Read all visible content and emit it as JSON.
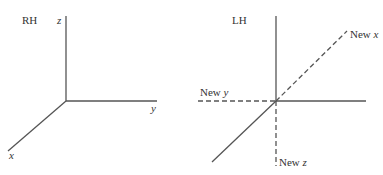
{
  "diagram": {
    "left_panel": {
      "title": "RH",
      "axes": {
        "z": {
          "label": "z"
        },
        "y": {
          "label": "y"
        },
        "x": {
          "label": "x"
        }
      }
    },
    "right_panel": {
      "title": "LH",
      "axes": {
        "new_x": {
          "prefix": "New ",
          "var": "x"
        },
        "new_y": {
          "prefix": "New ",
          "var": "y"
        },
        "new_z": {
          "prefix": "New ",
          "var": "z"
        }
      }
    },
    "colors": {
      "line": "#555555",
      "text": "#333333",
      "background": "#ffffff"
    }
  }
}
